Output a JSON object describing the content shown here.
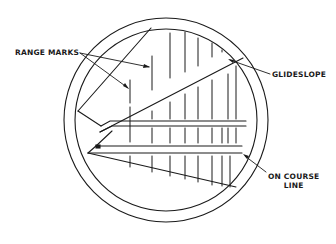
{
  "diagram": {
    "labels": {
      "range_marks": "RANGE MARKS",
      "glideslope": "GLIDESLOPE",
      "on_course_line_1": "ON COURSE",
      "on_course_line_2": "LINE"
    },
    "colors": {
      "stroke": "#1a1a1a",
      "background": "#ffffff"
    },
    "scope": {
      "center": [
        166,
        120
      ],
      "outer_radius": 102,
      "inner_radius": 91
    },
    "range_mark_positions_x": [
      130,
      152,
      170,
      185,
      198,
      212,
      222,
      230,
      238
    ]
  }
}
